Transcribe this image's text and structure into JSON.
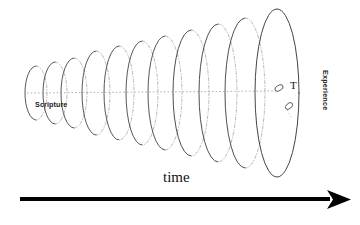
{
  "figure": {
    "title_label": "time",
    "axis_arrow": {
      "name": "time-arrow",
      "direction": "right",
      "color": "#000000"
    },
    "labels": {
      "start": "Scripture",
      "end": "Experience",
      "marker": "T",
      "time": "time"
    },
    "colors": {
      "ink": "#111111",
      "stroke": "#3a3a3a",
      "dotted": "#8a8a8a",
      "arrow": "#000000",
      "background": "#ffffff"
    },
    "cone": {
      "description": "expanding series of ellipses along a horizontal axis",
      "count": 11,
      "centerline_y": 93,
      "ellipses": [
        {
          "cx": 36,
          "rx": 11,
          "ry": 27
        },
        {
          "cx": 55,
          "rx": 12,
          "ry": 31
        },
        {
          "cx": 74,
          "rx": 13,
          "ry": 35
        },
        {
          "cx": 96,
          "rx": 14,
          "ry": 42
        },
        {
          "cx": 119,
          "rx": 15,
          "ry": 47
        },
        {
          "cx": 142,
          "rx": 16,
          "ry": 52
        },
        {
          "cx": 165,
          "rx": 17,
          "ry": 57
        },
        {
          "cx": 191,
          "rx": 18,
          "ry": 63
        },
        {
          "cx": 218,
          "rx": 19,
          "ry": 69
        },
        {
          "cx": 245,
          "rx": 20,
          "ry": 75
        },
        {
          "cx": 277,
          "rx": 22,
          "ry": 84
        }
      ]
    },
    "markers": [
      {
        "name": "marker-t-ellipse",
        "cx": 279,
        "cy": 88,
        "rx": 4.4,
        "ry": 2.6,
        "rotate": -28
      },
      {
        "name": "marker-secondary-ellipse",
        "cx": 289,
        "cy": 106,
        "rx": 4.2,
        "ry": 2.6,
        "rotate": -42
      }
    ]
  }
}
